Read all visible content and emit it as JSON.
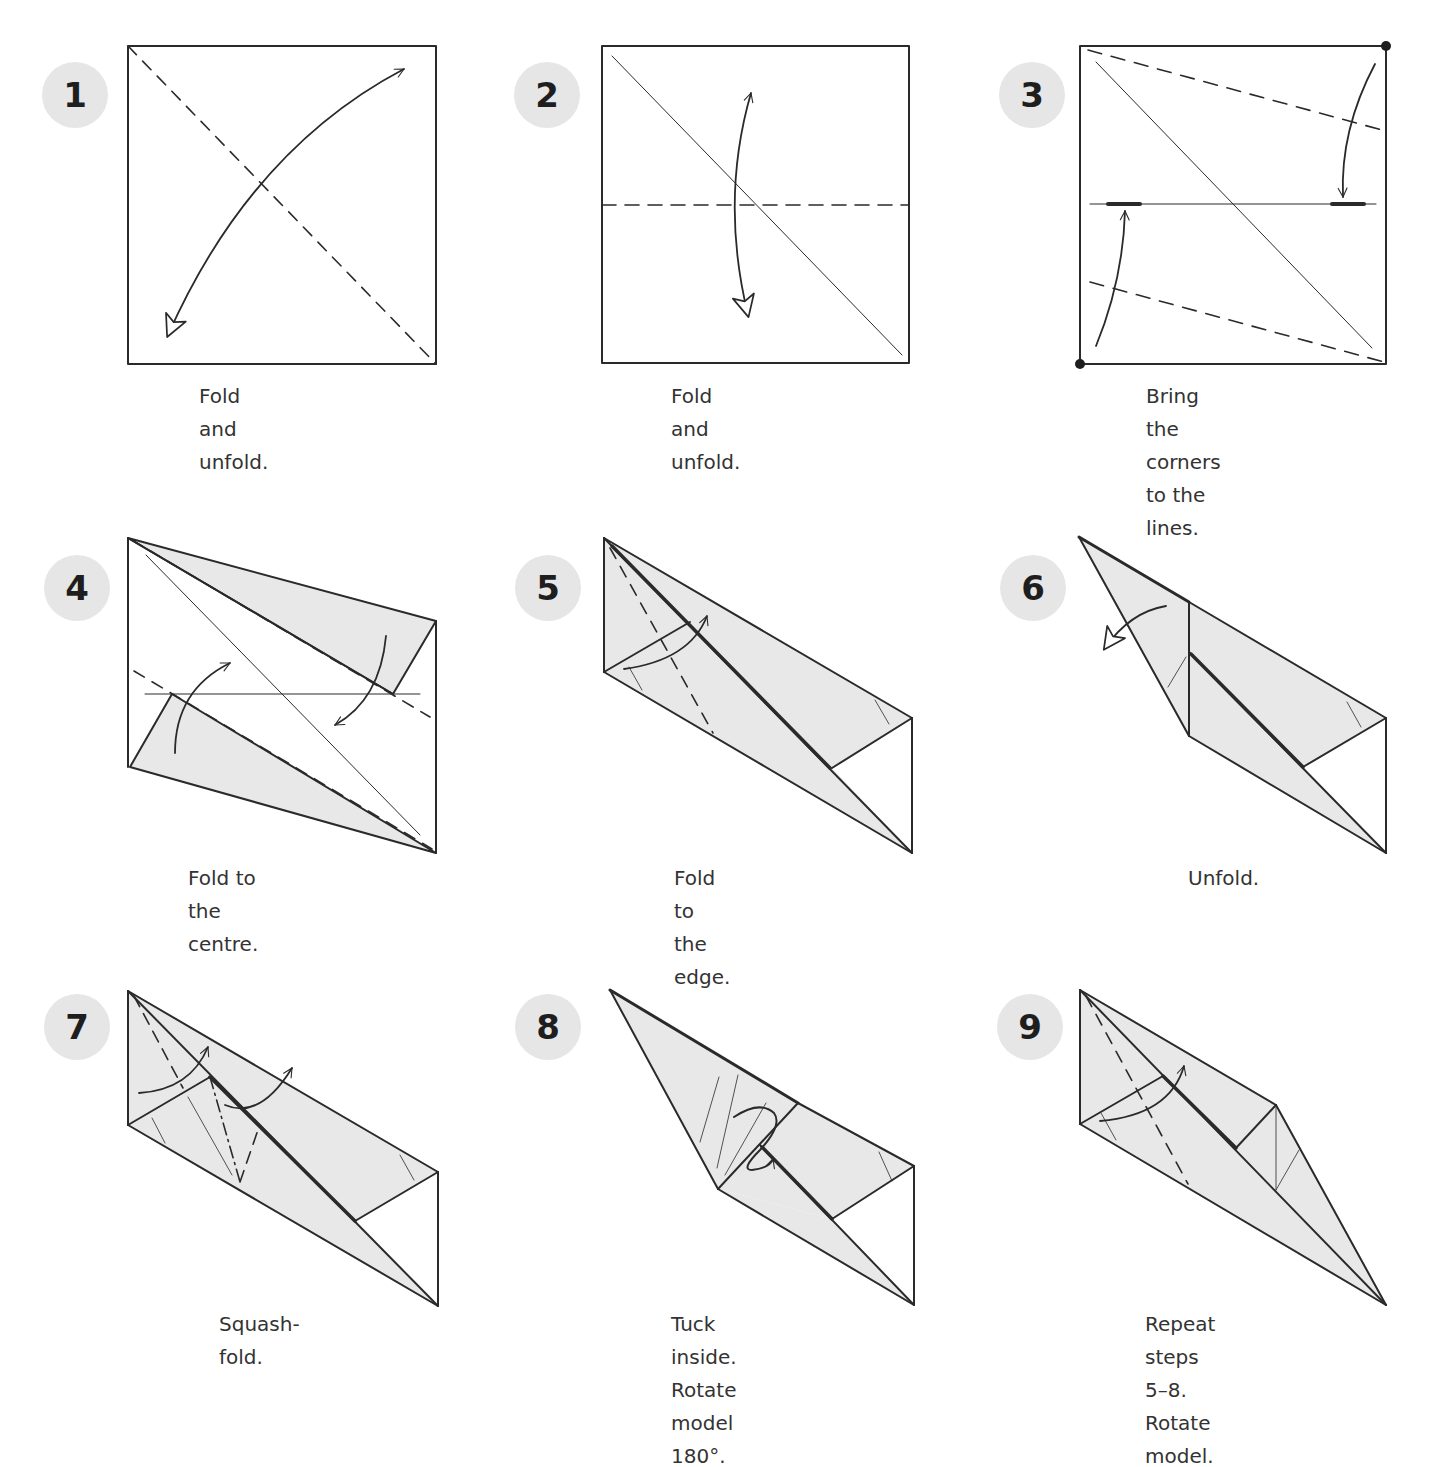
{
  "colors": {
    "line": "#2a2a2a",
    "fill": "#e8e8e8",
    "badge": "#e6e6e6",
    "text": "#333333"
  },
  "steps": [
    {
      "number": "1",
      "caption": "Fold and unfold.",
      "badge": [
        42,
        62
      ],
      "caption_pos": [
        199,
        380
      ]
    },
    {
      "number": "2",
      "caption": "Fold and unfold.",
      "badge": [
        514,
        62
      ],
      "caption_pos": [
        671,
        380
      ]
    },
    {
      "number": "3",
      "caption": "Bring the corners\nto the lines.",
      "badge": [
        999,
        62
      ],
      "caption_pos": [
        1146,
        380
      ]
    },
    {
      "number": "4",
      "caption": "Fold to the centre.",
      "badge": [
        44,
        555
      ],
      "caption_pos": [
        188,
        862
      ]
    },
    {
      "number": "5",
      "caption": "Fold to the edge.",
      "badge": [
        515,
        555
      ],
      "caption_pos": [
        674,
        862
      ]
    },
    {
      "number": "6",
      "caption": "Unfold.",
      "badge": [
        1000,
        555
      ],
      "caption_pos": [
        1188,
        862
      ]
    },
    {
      "number": "7",
      "caption": "Squash-fold.",
      "badge": [
        44,
        994
      ],
      "caption_pos": [
        219,
        1308
      ]
    },
    {
      "number": "8",
      "caption": "Tuck inside. Rotate\nmodel 180°.",
      "badge": [
        515,
        994
      ],
      "caption_pos": [
        671,
        1308
      ]
    },
    {
      "number": "9",
      "caption": "Repeat steps 5–8.\nRotate model.",
      "badge": [
        997,
        994
      ],
      "caption_pos": [
        1145,
        1308
      ]
    }
  ]
}
